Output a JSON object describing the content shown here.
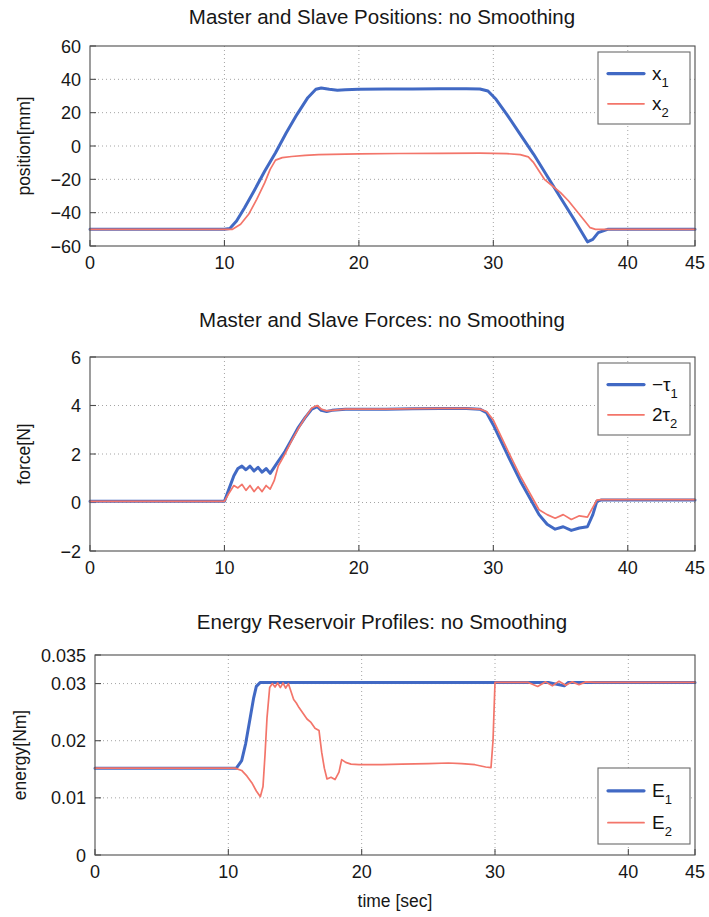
{
  "figure": {
    "colors": {
      "series1": "#4169c4",
      "series2": "#f3756a",
      "axis": "#4d4d4d",
      "grid": "#9a9a9a",
      "text": "#171717"
    }
  },
  "panels": [
    {
      "id": "positions",
      "title": "Master and Slave Positions: no Smoothing",
      "ylabel": "position[mm]",
      "xlabel": "",
      "yticks": [
        "60",
        "40",
        "20",
        "0",
        "−20",
        "−40",
        "−60"
      ],
      "xticks": [
        "0",
        "10",
        "20",
        "30",
        "40",
        "45"
      ],
      "legend": [
        {
          "base": "x",
          "sub": "1",
          "color": "#4169c4"
        },
        {
          "base": "x",
          "sub": "2",
          "color": "#f3756a"
        }
      ]
    },
    {
      "id": "forces",
      "title": "Master and Slave Forces: no Smoothing",
      "ylabel": "force[N]",
      "xlabel": "",
      "yticks": [
        "6",
        "4",
        "2",
        "0",
        "−2"
      ],
      "xticks": [
        "0",
        "10",
        "20",
        "30",
        "40",
        "45"
      ],
      "legend": [
        {
          "base": "−τ",
          "sub": "1",
          "color": "#4169c4"
        },
        {
          "base": "2τ",
          "sub": "2",
          "color": "#f3756a"
        }
      ]
    },
    {
      "id": "energy",
      "title": "Energy Reservoir Profiles: no Smoothing",
      "ylabel": "energy[Nm]",
      "xlabel": "time [sec]",
      "yticks": [
        "0.035",
        "0.03",
        "0.02",
        "0.01",
        "0"
      ],
      "xticks": [
        "0",
        "10",
        "20",
        "30",
        "40",
        "45"
      ],
      "legend": [
        {
          "base": "E",
          "sub": "1",
          "color": "#4169c4"
        },
        {
          "base": "E",
          "sub": "2",
          "color": "#f3756a"
        }
      ]
    }
  ],
  "chart_data": [
    {
      "type": "line",
      "title": "Master and Slave Positions: no Smoothing",
      "xlabel": "",
      "ylabel": "position[mm]",
      "xlim": [
        0,
        45
      ],
      "ylim": [
        -60,
        60
      ],
      "xticks": [
        0,
        10,
        20,
        30,
        40,
        45
      ],
      "yticks": [
        -60,
        -40,
        -20,
        0,
        20,
        40,
        60
      ],
      "grid": true,
      "legend_position": "upper-right",
      "series": [
        {
          "name": "x1",
          "color": "#4169c4",
          "x": [
            0,
            5,
            10,
            10.4,
            10.9,
            11.5,
            12.2,
            13,
            13.8,
            14.6,
            15.4,
            16.2,
            16.8,
            17.2,
            17.8,
            18.4,
            19,
            20,
            22,
            24,
            26,
            28,
            29,
            29.6,
            30.2,
            31,
            32,
            33,
            34,
            35,
            36,
            36.6,
            37,
            37.4,
            37.8,
            38.5,
            40,
            42,
            45
          ],
          "y": [
            -50,
            -50,
            -50,
            -49.5,
            -45,
            -37,
            -27,
            -15,
            -4,
            8,
            19,
            29,
            34,
            34.8,
            34,
            33.5,
            33.7,
            34,
            34.2,
            34.2,
            34.3,
            34.3,
            34.2,
            33,
            28,
            19,
            7,
            -5,
            -18,
            -31,
            -44,
            -52,
            -57.5,
            -56,
            -52,
            -50,
            -50,
            -50,
            -50
          ]
        },
        {
          "name": "x2",
          "color": "#f3756a",
          "x": [
            0,
            5,
            10,
            10.6,
            11.2,
            11.8,
            12.4,
            13,
            13.4,
            13.8,
            14.3,
            15,
            16,
            17,
            18,
            20,
            23,
            26,
            29,
            30,
            31,
            32,
            32.6,
            33,
            33.4,
            33.8,
            34.4,
            35,
            35.6,
            36.2,
            36.8,
            37.2,
            37.6,
            38.2,
            39,
            41,
            43,
            45
          ],
          "y": [
            -50,
            -50,
            -50,
            -50,
            -47,
            -41,
            -32,
            -22,
            -14,
            -8.5,
            -7,
            -6.3,
            -5.6,
            -5.2,
            -5,
            -4.7,
            -4.5,
            -4.4,
            -4.3,
            -4.4,
            -4.6,
            -5.2,
            -6.5,
            -10,
            -15,
            -20,
            -24,
            -28,
            -33,
            -39,
            -45,
            -49,
            -50,
            -50,
            -50,
            -50,
            -50,
            -50
          ]
        }
      ]
    },
    {
      "type": "line",
      "title": "Master and Slave Forces: no Smoothing",
      "xlabel": "",
      "ylabel": "force[N]",
      "xlim": [
        0,
        45
      ],
      "ylim": [
        -2,
        6
      ],
      "xticks": [
        0,
        10,
        20,
        30,
        40,
        45
      ],
      "yticks": [
        -2,
        0,
        2,
        4,
        6
      ],
      "grid": true,
      "legend_position": "upper-right",
      "series": [
        {
          "name": "-tau1",
          "color": "#4169c4",
          "x": [
            0,
            5,
            10,
            10.3,
            10.7,
            11,
            11.3,
            11.6,
            11.9,
            12.2,
            12.5,
            12.8,
            13.1,
            13.4,
            13.7,
            14,
            14.5,
            15,
            15.5,
            16,
            16.5,
            16.9,
            17.2,
            17.6,
            18,
            19,
            20,
            22,
            24,
            26,
            28,
            29,
            29.5,
            30,
            30.6,
            31.2,
            32,
            32.8,
            33.4,
            34,
            34.6,
            35.2,
            35.8,
            36.4,
            37,
            37.4,
            37.7,
            38,
            39,
            41,
            43,
            45
          ],
          "y": [
            0.05,
            0.05,
            0.05,
            0.5,
            1.1,
            1.4,
            1.5,
            1.35,
            1.5,
            1.3,
            1.45,
            1.25,
            1.4,
            1.2,
            1.45,
            1.7,
            2.1,
            2.6,
            3.1,
            3.5,
            3.85,
            3.95,
            3.8,
            3.75,
            3.8,
            3.85,
            3.85,
            3.85,
            3.87,
            3.88,
            3.88,
            3.85,
            3.7,
            3.2,
            2.5,
            1.8,
            0.9,
            0.1,
            -0.5,
            -0.9,
            -1.1,
            -1.0,
            -1.15,
            -1.05,
            -1.0,
            -0.5,
            0.05,
            0.1,
            0.1,
            0.1,
            0.1,
            0.1
          ]
        },
        {
          "name": "2tau2",
          "color": "#f3756a",
          "x": [
            0,
            5,
            10,
            10.3,
            10.7,
            11,
            11.3,
            11.6,
            11.9,
            12.2,
            12.5,
            12.8,
            13.1,
            13.4,
            13.7,
            14,
            14.5,
            15,
            15.5,
            16,
            16.5,
            16.9,
            17.2,
            17.6,
            18,
            19,
            20,
            22,
            24,
            26,
            28,
            29,
            29.5,
            30,
            30.6,
            31.2,
            32,
            32.8,
            33.4,
            34,
            34.6,
            35.2,
            35.8,
            36.4,
            37,
            37.4,
            37.7,
            38,
            39,
            41,
            43,
            45
          ],
          "y": [
            0.05,
            0.05,
            0.05,
            0.35,
            0.7,
            0.6,
            0.75,
            0.5,
            0.7,
            0.45,
            0.65,
            0.45,
            0.7,
            0.55,
            0.9,
            1.5,
            2.0,
            2.55,
            3.05,
            3.5,
            3.9,
            4.0,
            3.85,
            3.78,
            3.8,
            3.85,
            3.85,
            3.85,
            3.87,
            3.88,
            3.88,
            3.85,
            3.75,
            3.4,
            2.7,
            2.0,
            1.1,
            0.3,
            -0.3,
            -0.5,
            -0.65,
            -0.5,
            -0.7,
            -0.55,
            -0.6,
            -0.2,
            0.1,
            0.12,
            0.12,
            0.12,
            0.12,
            0.12
          ]
        }
      ]
    },
    {
      "type": "line",
      "title": "Energy Reservoir Profiles: no Smoothing",
      "xlabel": "time [sec]",
      "ylabel": "energy[Nm]",
      "xlim": [
        0,
        45
      ],
      "ylim": [
        0,
        0.035
      ],
      "xticks": [
        0,
        10,
        20,
        30,
        40,
        45
      ],
      "yticks": [
        0,
        0.01,
        0.02,
        0.03,
        0.035
      ],
      "grid": true,
      "legend_position": "lower-right",
      "series": [
        {
          "name": "E1",
          "color": "#4169c4",
          "x": [
            0,
            5,
            10,
            10.6,
            11,
            11.3,
            11.6,
            11.9,
            12.1,
            12.4,
            13,
            15,
            20,
            25,
            29,
            30,
            32,
            34,
            35.2,
            35.5,
            36,
            38,
            41,
            45
          ],
          "y": [
            0.0152,
            0.0152,
            0.0152,
            0.0152,
            0.0165,
            0.0195,
            0.0235,
            0.0275,
            0.0295,
            0.0302,
            0.0302,
            0.0302,
            0.0302,
            0.0302,
            0.0302,
            0.0302,
            0.0302,
            0.0302,
            0.0296,
            0.0302,
            0.0302,
            0.0302,
            0.0302,
            0.0302
          ]
        },
        {
          "name": "E2",
          "color": "#f3756a",
          "x": [
            0,
            5,
            10,
            10.5,
            11,
            11.4,
            11.8,
            12.1,
            12.4,
            12.6,
            12.75,
            12.9,
            13.1,
            13.3,
            13.5,
            13.7,
            13.9,
            14.1,
            14.3,
            14.5,
            14.7,
            14.9,
            15.1,
            15.3,
            15.6,
            15.9,
            16.2,
            16.5,
            16.8,
            17.0,
            17.2,
            17.4,
            17.7,
            18.0,
            18.3,
            18.5,
            18.8,
            19.2,
            19.8,
            20.5,
            21.5,
            23,
            25,
            26.5,
            27.5,
            28.5,
            29.3,
            29.7,
            29.85,
            30.0,
            30.5,
            31.5,
            32.5,
            33.2,
            33.8,
            34.3,
            34.8,
            35.3,
            35.8,
            36.3,
            36.8,
            37.5,
            38.5,
            40,
            42,
            45
          ],
          "y": [
            0.0152,
            0.0152,
            0.0152,
            0.0152,
            0.0148,
            0.0138,
            0.0125,
            0.0112,
            0.0102,
            0.012,
            0.0175,
            0.024,
            0.0293,
            0.03,
            0.0294,
            0.0301,
            0.0293,
            0.0301,
            0.0292,
            0.03,
            0.0286,
            0.0272,
            0.0266,
            0.0258,
            0.0248,
            0.0238,
            0.0232,
            0.0222,
            0.0218,
            0.018,
            0.0152,
            0.0133,
            0.0136,
            0.0132,
            0.0145,
            0.0167,
            0.0162,
            0.0159,
            0.0158,
            0.0158,
            0.0158,
            0.0159,
            0.016,
            0.0161,
            0.016,
            0.0158,
            0.0154,
            0.0153,
            0.02,
            0.0302,
            0.0302,
            0.0302,
            0.0302,
            0.0295,
            0.0303,
            0.0296,
            0.0304,
            0.0297,
            0.0303,
            0.0298,
            0.0303,
            0.0302,
            0.0302,
            0.0302,
            0.0302,
            0.0302
          ]
        }
      ]
    }
  ]
}
